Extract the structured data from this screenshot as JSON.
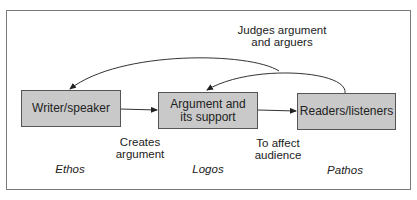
{
  "diagram": {
    "nodes": [
      {
        "id": "writer",
        "label": "Writer/speaker"
      },
      {
        "id": "argument",
        "label": "Argument and its support",
        "line1": "Argument and",
        "line2": "its support"
      },
      {
        "id": "readers",
        "label": "Readers/listeners"
      }
    ],
    "edges": [
      {
        "from": "writer",
        "to": "argument",
        "label_line1": "Creates",
        "label_line2": "argument"
      },
      {
        "from": "argument",
        "to": "readers",
        "label_line1": "To affect",
        "label_line2": "audience"
      },
      {
        "from": "readers",
        "to": "writer",
        "label": "Judges argument and arguers"
      },
      {
        "from": "readers",
        "to": "argument",
        "label": ""
      }
    ],
    "top_label_line1": "Judges argument",
    "top_label_line2": "and arguers",
    "appeals": [
      "Ethos",
      "Logos",
      "Pathos"
    ],
    "colors": {
      "box_fill": "#c9c9c9",
      "stroke": "#333333"
    }
  }
}
